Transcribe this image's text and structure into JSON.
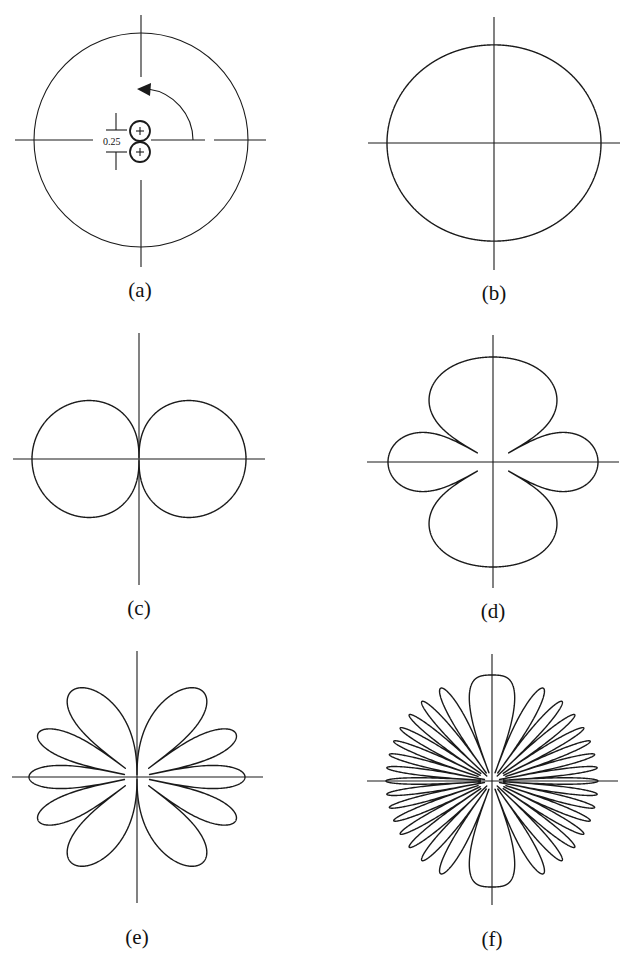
{
  "figure": {
    "stroke_color": "#1a1a1a",
    "background": "#ffffff"
  },
  "panels": [
    {
      "id": "a",
      "label": "(a)",
      "type": "source-geometry",
      "center": [
        141,
        140
      ],
      "circle_radius": 107,
      "spacing_label": "0.25",
      "sources": [
        {
          "center": [
            140,
            131
          ],
          "radius": 10,
          "sign": "+"
        },
        {
          "center": [
            140,
            152
          ],
          "radius": 10,
          "sign": "+"
        }
      ],
      "angle_arrow": {
        "radius": 52,
        "from_deg": 0,
        "to_deg": 88
      },
      "label_pos": [
        140,
        297
      ]
    },
    {
      "id": "b",
      "label": "(b)",
      "type": "pattern",
      "center": [
        494,
        143
      ],
      "radius": 107,
      "phase_factor": 0.41,
      "exponent": 1,
      "axis_h": [
        368,
        620
      ],
      "axis_v": [
        17,
        270
      ],
      "label_pos": [
        494,
        300
      ]
    },
    {
      "id": "c",
      "label": "(c)",
      "type": "pattern",
      "center": [
        139,
        459
      ],
      "radius": 107,
      "phase_factor": 1.5708,
      "exponent": 0.33,
      "axis_h": [
        13,
        265
      ],
      "axis_v": [
        333,
        585
      ],
      "label_pos": [
        139,
        615
      ]
    },
    {
      "id": "d",
      "label": "(d)",
      "type": "pattern",
      "center": [
        493,
        462
      ],
      "radius": 105,
      "phase_factor": 3.1416,
      "exponent": 0.3,
      "axis_h": [
        367,
        619
      ],
      "axis_v": [
        335,
        588
      ],
      "label_pos": [
        493,
        618
      ]
    },
    {
      "id": "e",
      "label": "(e)",
      "type": "pattern",
      "center": [
        137,
        777
      ],
      "radius": 108,
      "phase_factor": 7.854,
      "exponent": 0.35,
      "axis_h": [
        12,
        263
      ],
      "axis_v": [
        651,
        903
      ],
      "label_pos": [
        137,
        944
      ]
    },
    {
      "id": "f",
      "label": "(f)",
      "type": "pattern",
      "center": [
        492,
        781
      ],
      "radius": 106,
      "phase_factor": 25.133,
      "exponent": 0.45,
      "axis_h": [
        367,
        618
      ],
      "axis_v": [
        654,
        905
      ],
      "label_pos": [
        492,
        946
      ]
    }
  ],
  "chart_data": {
    "type": "polar",
    "title": "",
    "pattern_formula": "E(theta) = |cos(k * sin(theta))|, k = pi*d/lambda, theta from horizontal axis",
    "series": [
      {
        "name": "(b)",
        "lobes": 2,
        "vertical_to_horizontal_ratio": 0.92
      },
      {
        "name": "(c)",
        "lobes": 2,
        "lobe_angles_deg": [
          0,
          180
        ],
        "null_angles_deg": [
          90,
          270
        ]
      },
      {
        "name": "(d)",
        "lobes": 4,
        "lobe_angles_deg": [
          0,
          90,
          180,
          270
        ]
      },
      {
        "name": "(e)",
        "lobes": 10,
        "lobe_angles_deg": [
          0,
          23.6,
          53.1,
          126.9,
          156.4,
          180,
          203.6,
          233.1,
          306.9,
          336.4
        ]
      },
      {
        "name": "(f)",
        "lobes": 32,
        "lobe_angles_deg_first_quadrant": [
          0,
          7.2,
          14.5,
          22.0,
          30.0,
          38.7,
          48.6,
          61.0,
          90
        ]
      }
    ],
    "annotations": [
      "0.25"
    ],
    "grid": false
  }
}
